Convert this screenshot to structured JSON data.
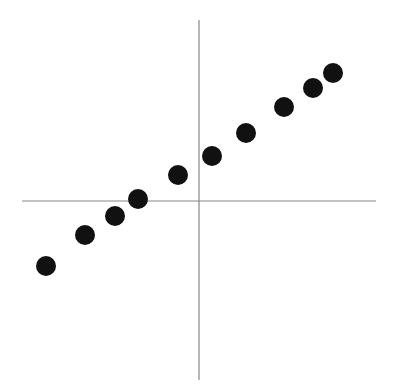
{
  "chart_data": {
    "type": "scatter",
    "title": "",
    "xlabel": "",
    "ylabel": "",
    "grid": false,
    "legend": null,
    "axes_style": "cross through origin, no ticks or labels",
    "xlim": [
      -177,
      177
    ],
    "ylim": [
      -179,
      181
    ],
    "origin_px": [
      199,
      201
    ],
    "points": [
      {
        "x": -153,
        "y": -65
      },
      {
        "x": -114,
        "y": -34
      },
      {
        "x": -84,
        "y": -15
      },
      {
        "x": -61,
        "y": 2
      },
      {
        "x": -21,
        "y": 26
      },
      {
        "x": 13,
        "y": 45
      },
      {
        "x": 47,
        "y": 68
      },
      {
        "x": 85,
        "y": 94
      },
      {
        "x": 114,
        "y": 113
      },
      {
        "x": 134,
        "y": 128
      }
    ],
    "marker": {
      "shape": "circle",
      "radius": 10,
      "color": "#111111"
    },
    "axis_color": "#888888"
  }
}
